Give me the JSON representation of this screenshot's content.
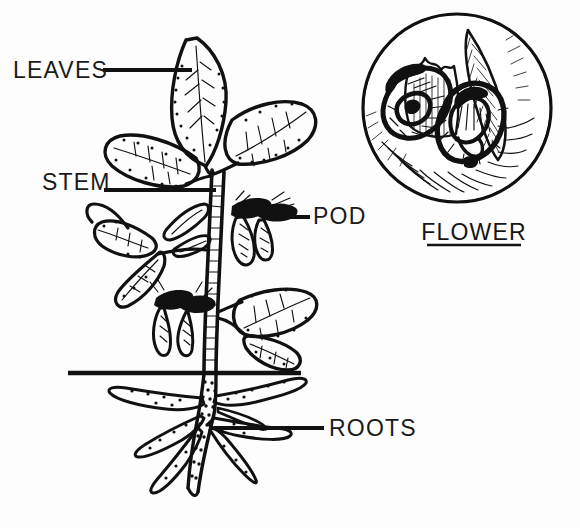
{
  "diagram": {
    "style": "black-and-white-ink-illustration",
    "background_color": "#fdfdfd",
    "ink_color": "#111111"
  },
  "labels": [
    {
      "id": "leaves",
      "text": "LEAVES",
      "text_x": 13,
      "text_y": 78,
      "leader": {
        "x1": 103,
        "y1": 70,
        "x2": 192,
        "y2": 70
      },
      "anchor": "start"
    },
    {
      "id": "stem",
      "text": "STEM",
      "text_x": 42,
      "text_y": 190,
      "leader": {
        "x1": 104,
        "y1": 190,
        "x2": 216,
        "y2": 190
      },
      "anchor": "start"
    },
    {
      "id": "pod",
      "text": "POD",
      "text_x": 313,
      "text_y": 224,
      "leader": {
        "x1": 266,
        "y1": 217,
        "x2": 310,
        "y2": 217
      },
      "anchor": "start"
    },
    {
      "id": "roots",
      "text": "ROOTS",
      "text_x": 329,
      "text_y": 436,
      "leader": {
        "x1": 214,
        "y1": 428,
        "x2": 324,
        "y2": 428
      },
      "anchor": "start"
    }
  ],
  "inset": {
    "id": "flower-inset",
    "caption": "FLOWER",
    "caption_x": 474,
    "caption_y": 240,
    "underline": {
      "x1": 427,
      "y1": 245,
      "x2": 521,
      "y2": 245
    },
    "circle": {
      "cx": 457,
      "cy": 108,
      "r": 94
    }
  },
  "soil_line": {
    "x1": 68,
    "y1": 373,
    "x2": 301,
    "y2": 373
  },
  "parts": [
    "leaves",
    "stem",
    "pod",
    "roots",
    "flower"
  ],
  "colors": {
    "ink": "#111111",
    "paper": "#fdfdfd",
    "label_text": "#1a1a1a"
  }
}
